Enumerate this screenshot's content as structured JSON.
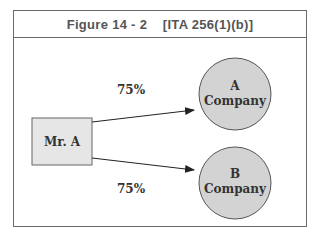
{
  "figure": {
    "title": "Figure 14 - 2    [ITA 256(1)(b)]"
  },
  "nodes": {
    "owner": {
      "label": "Mr. A",
      "shape": "rectangle",
      "fill": "#e6e6e6"
    },
    "company_a": {
      "line1": "A",
      "line2": "Company",
      "shape": "circle",
      "fill": "#d3d3d3"
    },
    "company_b": {
      "line1": "B",
      "line2": "Company",
      "shape": "circle",
      "fill": "#d3d3d3"
    }
  },
  "edges": [
    {
      "from": "Mr. A",
      "to": "A Company",
      "label": "75%"
    },
    {
      "from": "Mr. A",
      "to": "B Company",
      "label": "75%"
    }
  ],
  "colors": {
    "stroke": "#555555",
    "frame": "#6b6b6b",
    "text": "#333333"
  }
}
